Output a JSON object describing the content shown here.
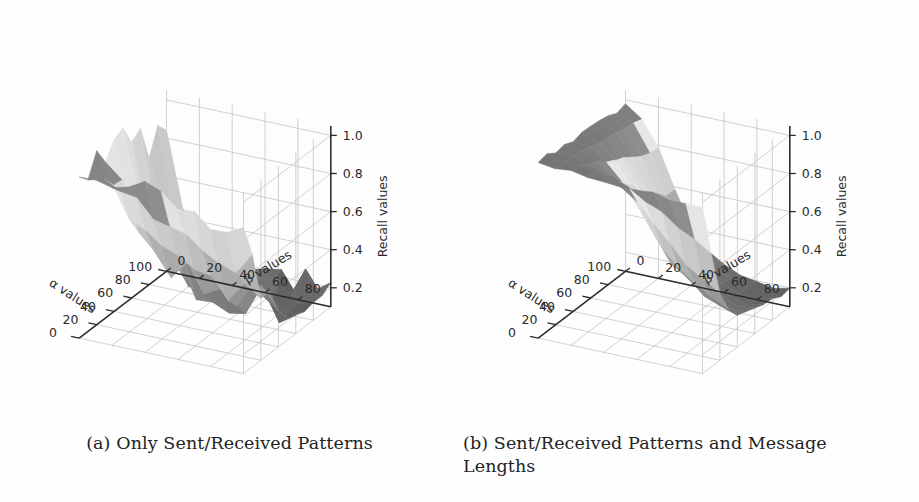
{
  "figure": {
    "kind": "two-panel-3d-surface-figure",
    "background_color": "#fefefe"
  },
  "panels": [
    {
      "id": "panel-a",
      "caption": "(a) Only Sent/Received Patterns",
      "caption_lines": [
        "(a) Only Sent/Received Patterns"
      ]
    },
    {
      "id": "panel-b",
      "caption": "(b) Sent/Received Patterns and Message Lengths",
      "caption_lines": [
        "(b) Sent/Received Patterns and Message",
        "Lengths"
      ]
    }
  ],
  "chart_data": [
    {
      "type": "surface",
      "panel": "a",
      "title": "",
      "xlabel": "α values",
      "ylabel": "β values",
      "zlabel": "Recall values",
      "xticks": [
        0,
        20,
        40,
        60,
        80,
        100
      ],
      "yticks": [
        0,
        20,
        40,
        60,
        80
      ],
      "zticks": [
        0.2,
        0.4,
        0.6,
        0.8,
        1.0
      ],
      "xlim": [
        0,
        100
      ],
      "ylim": [
        0,
        100
      ],
      "zlim": [
        0.1,
        1.05
      ],
      "grid": true,
      "colormap": "grayscale",
      "legend": "none",
      "x": [
        0,
        10,
        20,
        30,
        40,
        50,
        60,
        70,
        80,
        90,
        100
      ],
      "y": [
        0,
        10,
        20,
        30,
        40,
        50,
        60,
        70,
        80,
        90,
        100
      ],
      "z": [
        [
          1.0,
          1.0,
          1.0,
          0.99,
          0.98,
          0.97,
          0.95,
          0.93,
          0.92,
          0.91,
          0.9
        ],
        [
          1.0,
          0.96,
          0.88,
          0.8,
          0.74,
          0.7,
          0.67,
          0.64,
          0.62,
          0.6,
          0.58
        ],
        [
          0.99,
          0.86,
          0.72,
          0.62,
          0.55,
          0.51,
          0.48,
          0.46,
          0.44,
          0.43,
          0.42
        ],
        [
          0.97,
          0.76,
          0.6,
          0.5,
          0.43,
          0.39,
          0.37,
          0.36,
          0.35,
          0.34,
          0.33
        ],
        [
          0.95,
          0.68,
          0.52,
          0.42,
          0.36,
          0.33,
          0.31,
          0.3,
          0.3,
          0.29,
          0.29
        ],
        [
          0.93,
          0.62,
          0.46,
          0.37,
          0.32,
          0.29,
          0.28,
          0.27,
          0.27,
          0.26,
          0.26
        ],
        [
          0.91,
          0.57,
          0.42,
          0.34,
          0.29,
          0.27,
          0.26,
          0.25,
          0.25,
          0.24,
          0.24
        ],
        [
          0.89,
          0.53,
          0.39,
          0.31,
          0.27,
          0.25,
          0.24,
          0.23,
          0.23,
          0.23,
          0.22
        ],
        [
          0.87,
          0.5,
          0.36,
          0.29,
          0.26,
          0.24,
          0.23,
          0.22,
          0.22,
          0.22,
          0.21
        ],
        [
          0.85,
          0.47,
          0.34,
          0.28,
          0.25,
          0.23,
          0.22,
          0.22,
          0.21,
          0.21,
          0.21
        ],
        [
          0.83,
          0.45,
          0.33,
          0.27,
          0.24,
          0.23,
          0.22,
          0.21,
          0.21,
          0.21,
          0.2
        ]
      ],
      "roughness": 0.085,
      "description": "Jagged/noisy surface: recall ~1.0 along the low-alpha/low-beta ridge, dropping steeply and irregularly to ~0.2 at high alpha and high beta."
    },
    {
      "type": "surface",
      "panel": "b",
      "title": "",
      "xlabel": "α values",
      "ylabel": "β values",
      "zlabel": "Recall values",
      "xticks": [
        0,
        20,
        40,
        60,
        80,
        100
      ],
      "yticks": [
        0,
        20,
        40,
        60,
        80
      ],
      "zticks": [
        0.2,
        0.4,
        0.6,
        0.8,
        1.0
      ],
      "xlim": [
        0,
        100
      ],
      "ylim": [
        0,
        100
      ],
      "zlim": [
        0.1,
        1.05
      ],
      "grid": true,
      "colormap": "grayscale",
      "legend": "none",
      "x": [
        0,
        10,
        20,
        30,
        40,
        50,
        60,
        70,
        80,
        90,
        100
      ],
      "y": [
        0,
        10,
        20,
        30,
        40,
        50,
        60,
        70,
        80,
        90,
        100
      ],
      "z": [
        [
          1.02,
          1.02,
          1.01,
          1.01,
          1.0,
          1.0,
          0.99,
          0.99,
          0.98,
          0.98,
          0.97
        ],
        [
          1.02,
          1.01,
          1.0,
          0.99,
          0.97,
          0.94,
          0.9,
          0.85,
          0.8,
          0.75,
          0.71
        ],
        [
          1.01,
          1.0,
          0.98,
          0.95,
          0.9,
          0.83,
          0.74,
          0.65,
          0.57,
          0.51,
          0.46
        ],
        [
          1.01,
          0.99,
          0.96,
          0.9,
          0.81,
          0.7,
          0.59,
          0.49,
          0.42,
          0.37,
          0.33
        ],
        [
          1.0,
          0.98,
          0.93,
          0.84,
          0.72,
          0.59,
          0.47,
          0.39,
          0.33,
          0.29,
          0.27
        ],
        [
          1.0,
          0.97,
          0.9,
          0.78,
          0.63,
          0.5,
          0.39,
          0.32,
          0.28,
          0.25,
          0.24
        ],
        [
          0.99,
          0.96,
          0.87,
          0.72,
          0.56,
          0.43,
          0.34,
          0.28,
          0.25,
          0.23,
          0.22
        ],
        [
          0.99,
          0.95,
          0.84,
          0.67,
          0.5,
          0.38,
          0.3,
          0.25,
          0.23,
          0.21,
          0.21
        ],
        [
          0.98,
          0.94,
          0.82,
          0.63,
          0.46,
          0.34,
          0.27,
          0.23,
          0.21,
          0.2,
          0.2
        ],
        [
          0.98,
          0.93,
          0.8,
          0.6,
          0.43,
          0.32,
          0.25,
          0.22,
          0.2,
          0.2,
          0.19
        ],
        [
          0.97,
          0.92,
          0.78,
          0.58,
          0.41,
          0.3,
          0.24,
          0.21,
          0.2,
          0.19,
          0.19
        ]
      ],
      "roughness": 0.012,
      "description": "Smooth surface: broad high plateau at recall ~1.0 for low alpha/beta, then a smooth monotone descent to ~0.2 in the far high-alpha/high-beta corner."
    }
  ]
}
